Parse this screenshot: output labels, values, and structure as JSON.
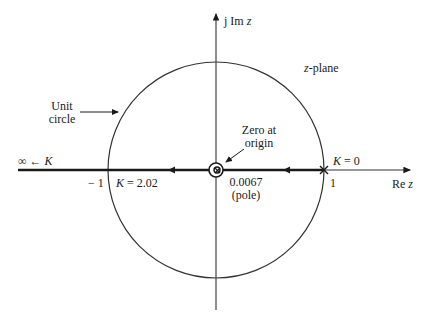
{
  "diagram": {
    "type": "root-locus-z-plane",
    "axes": {
      "imag_label_prefix": "j Im ",
      "imag_label_var": "z",
      "real_label_prefix": "Re ",
      "real_label_var": "z"
    },
    "plane_label_var": "z",
    "plane_label_suffix": "-plane",
    "unit_circle_label_line1": "Unit",
    "unit_circle_label_line2": "circle",
    "zero_label_line1": "Zero at",
    "zero_label_line2": "origin",
    "pole_label_line1": "0.0067",
    "pole_label_line2": "(pole)",
    "k_zero_label": "K = 0",
    "k_break_label": "K = 2.02",
    "k_infinity_label_prefix": "∞ ← ",
    "k_infinity_label_var": "K",
    "tick_minus_one": "− 1",
    "tick_one": "1",
    "colors": {
      "ink": "#1a1a1a",
      "background": "#ffffff"
    }
  }
}
